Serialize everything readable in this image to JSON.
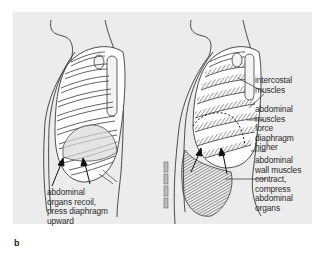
{
  "figure": {
    "panel_letter": "b",
    "background_color": "#ececec",
    "line_color": "#3a3a3a",
    "left_diagram": {
      "description": "rib cage during exhalation, passive recoil",
      "labels": [
        {
          "id": "abdominal-organs-recoil",
          "lines": [
            "abdominal",
            "organs recoil,",
            "press diaphragm",
            "upward"
          ]
        }
      ]
    },
    "right_diagram": {
      "description": "rib cage during forced exhalation with muscle contraction",
      "labels": [
        {
          "id": "intercostal-muscles",
          "lines": [
            "intercostal",
            "muscles"
          ]
        },
        {
          "id": "abdominal-muscles-force",
          "lines": [
            "abdominal",
            "muscles",
            "force",
            "diaphragm",
            "higher"
          ]
        },
        {
          "id": "abdominal-wall-muscles",
          "lines": [
            "abdominal",
            "wall muscles",
            "contract,",
            "compress",
            "abdominal",
            "organs"
          ]
        }
      ]
    }
  }
}
